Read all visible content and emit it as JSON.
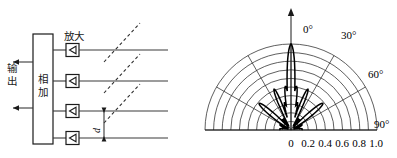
{
  "figure": {
    "caption_left": "相控阵天线相加网络框图",
    "caption_right": "天线方向图"
  },
  "left_diagram": {
    "combiner_label": "相加",
    "output_label": "输出",
    "amplifier_label": "放大",
    "spacing_label": "d",
    "amplifier_icon": "triangle-left-icon",
    "output_arrow_icon": "arrow-left-icon",
    "dimension_arrow_icon": "double-arrow-vertical-icon",
    "channel_count": 4,
    "wavefront_count": 3
  },
  "chart_data": {
    "type": "line",
    "subtype": "polar-radiation-pattern",
    "title": "",
    "xlabel": "",
    "ylabel": "",
    "radial_ticks": [
      "0",
      "0.2",
      "0.4",
      "0.6",
      "0.8",
      "1.0"
    ],
    "radial_tick_values": [
      0,
      0.2,
      0.4,
      0.6,
      0.8,
      1.0
    ],
    "rlim": [
      0,
      1.0
    ],
    "grid_circles": 10,
    "grid_circle_step": 0.1,
    "angle_ticks": [
      "0°",
      "30°",
      "60°",
      "90°"
    ],
    "angle_tick_values": [
      0,
      30,
      60,
      90
    ],
    "angle_spoke_step_deg": 30,
    "theta_range_deg": [
      -90,
      90
    ],
    "grid": true,
    "legend": "none",
    "north_arrow_icon": "arrow-up-icon",
    "series": [
      {
        "name": "Array factor |AF|",
        "theta_deg": [
          -90,
          -84,
          -78,
          -72,
          -66,
          -60,
          -54,
          -48,
          -42,
          -36,
          -30,
          -26,
          -22,
          -18,
          -15,
          -12,
          -9,
          -6,
          -3,
          0,
          3,
          6,
          9,
          12,
          15,
          18,
          22,
          26,
          30,
          36,
          42,
          48,
          54,
          60,
          66,
          72,
          78,
          84,
          90
        ],
        "values": [
          0.02,
          0.05,
          0.03,
          0.06,
          0.03,
          0.07,
          0.04,
          0.07,
          0.04,
          0.08,
          0.05,
          0.09,
          0.12,
          0.2,
          0.31,
          0.46,
          0.63,
          0.8,
          0.94,
          1.0,
          0.94,
          0.8,
          0.63,
          0.46,
          0.31,
          0.2,
          0.12,
          0.09,
          0.05,
          0.08,
          0.04,
          0.07,
          0.04,
          0.07,
          0.03,
          0.06,
          0.03,
          0.05,
          0.02
        ],
        "main_lobe_peak": 1.0,
        "main_lobe_direction_deg": 0,
        "sidelobe_peak": 0.09
      }
    ]
  }
}
